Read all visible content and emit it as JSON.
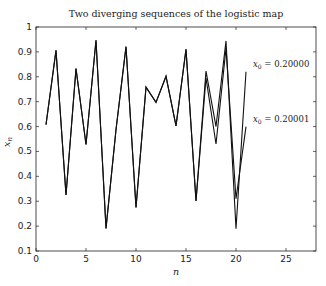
{
  "chart_data": {
    "type": "line",
    "title": "Two diverging sequences of the logistic map",
    "xlabel": "n",
    "ylabel": "x_n",
    "xlim": [
      0,
      28
    ],
    "ylim": [
      0.1,
      1
    ],
    "xticks": [
      0,
      5,
      10,
      15,
      20,
      25
    ],
    "yticks": [
      0.1,
      0.2,
      0.3,
      0.4,
      0.5,
      0.6,
      0.7,
      0.8,
      0.9,
      1
    ],
    "grid": false,
    "x": [
      1,
      2,
      3,
      4,
      5,
      6,
      7,
      8,
      9,
      10,
      11,
      12,
      13,
      14,
      15,
      16,
      17,
      18,
      19,
      20,
      21
    ],
    "series": [
      {
        "name": "x_0 = 0.20000",
        "label": "0.20000",
        "values": [
          0.608,
          0.906,
          0.325,
          0.833,
          0.528,
          0.947,
          0.191,
          0.587,
          0.921,
          0.275,
          0.758,
          0.697,
          0.802,
          0.603,
          0.91,
          0.301,
          0.823,
          0.6,
          0.944,
          0.19,
          0.82
        ]
      },
      {
        "name": "x_0 = 0.20001",
        "label": "0.20001",
        "values": [
          0.608,
          0.906,
          0.325,
          0.833,
          0.528,
          0.947,
          0.191,
          0.587,
          0.921,
          0.275,
          0.758,
          0.697,
          0.802,
          0.603,
          0.91,
          0.301,
          0.795,
          0.53,
          0.915,
          0.31,
          0.6
        ]
      }
    ],
    "annotations": [
      {
        "text": "x_0 = 0.20000",
        "x": 21.5,
        "y": 0.84
      },
      {
        "text": "x_0 = 0.20001",
        "x": 21.5,
        "y": 0.62
      }
    ]
  }
}
